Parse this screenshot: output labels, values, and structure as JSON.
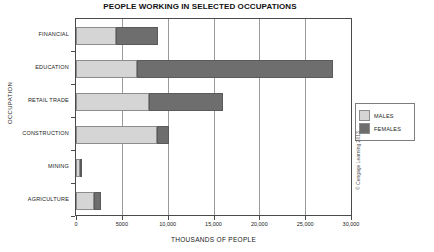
{
  "chart_data": {
    "type": "bar",
    "orientation": "horizontal",
    "stacked": true,
    "title": "PEOPLE WORKING IN SELECTED OCCUPATIONS",
    "xlabel": "THOUSANDS OF PEOPLE",
    "ylabel": "OCCUPATION",
    "categories": [
      "FINANCIAL",
      "EDUCATION",
      "RETAIL TRADE",
      "CONSTRUCTION",
      "MINING",
      "AGRICULTURE"
    ],
    "series": [
      {
        "name": "MALES",
        "color": "#d5d5d5",
        "values": [
          4400,
          6600,
          8000,
          8800,
          400,
          2000
        ]
      },
      {
        "name": "FEMALES",
        "color": "#6e6e6e",
        "values": [
          4500,
          21400,
          8000,
          1300,
          100,
          700
        ]
      }
    ],
    "totals": [
      8900,
      28000,
      16000,
      10100,
      500,
      2700
    ],
    "xlim": [
      0,
      30000
    ],
    "xticks": [
      0,
      5000,
      10000,
      15000,
      20000,
      25000,
      30000
    ],
    "xtick_labels": [
      "0",
      "5000",
      "10,000",
      "15,000",
      "20,000",
      "25,000",
      "30,000"
    ],
    "grid": "vertical",
    "legend_position": "right"
  },
  "legend": {
    "items": [
      {
        "label": "MALES",
        "color": "#d5d5d5"
      },
      {
        "label": "FEMALES",
        "color": "#6e6e6e"
      }
    ]
  },
  "attribution": {
    "text": "© Cengage Learning 2013"
  }
}
